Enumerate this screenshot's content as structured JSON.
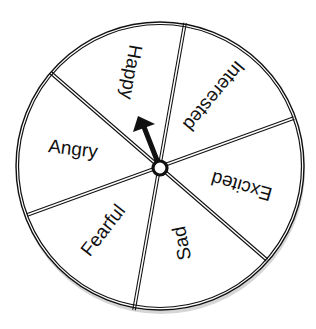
{
  "spinner": {
    "center": {
      "x": 160,
      "y": 168
    },
    "radius": 144,
    "hub_radius": 7,
    "colors": {
      "outline": "#111111",
      "fill": "#ffffff",
      "shadow": "#cfcfcf",
      "arrow": "#111111"
    },
    "pointer": {
      "tip": {
        "x": 138,
        "y": 116
      },
      "points_to": "Happy"
    },
    "dividers": [
      {
        "x1": 185,
        "y1": 23,
        "x2": 134,
        "y2": 310
      },
      {
        "x1": 51,
        "y1": 73,
        "x2": 267,
        "y2": 260
      },
      {
        "x1": 294,
        "y1": 118,
        "x2": 27,
        "y2": 215
      }
    ],
    "segments": [
      {
        "label": "Happy",
        "x": 130,
        "y": 72,
        "rotate": 100
      },
      {
        "label": "Interested",
        "x": 213,
        "y": 95,
        "rotate": 130
      },
      {
        "label": "Excited",
        "x": 242,
        "y": 185,
        "rotate": 196
      },
      {
        "label": "Sad",
        "x": 183,
        "y": 243,
        "rotate": -101
      },
      {
        "label": "Fearful",
        "x": 104,
        "y": 231,
        "rotate": -52
      },
      {
        "label": "Angry",
        "x": 73,
        "y": 150,
        "rotate": 7
      }
    ]
  }
}
